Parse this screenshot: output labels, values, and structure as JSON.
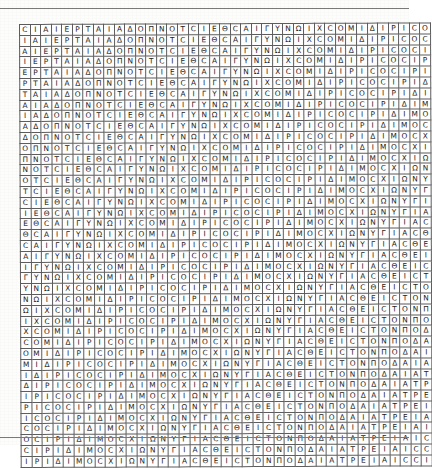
{
  "page": {
    "background_color": "#fdfdfc",
    "rule_color": "#7a7a7a",
    "width": 409,
    "height": 445
  },
  "grid": {
    "name": "greek-letter-diagonal-grid",
    "rows": 41,
    "columns": 39,
    "cell_width": 9.538,
    "cell_height": 9.805,
    "line_color": "#5d5d5d",
    "text_color": "#1d1d1d",
    "cell_background": "#ffffff",
    "description": "Square lattice of hand-lettered Greek/Latin capitals; every row is the preceding row shifted one cell to the left, producing diagonal stripes of identical letters.",
    "alphabet": [
      "A",
      "C",
      "E",
      "I",
      "M",
      "N",
      "O",
      "P",
      "T",
      "X",
      "Y",
      "Δ",
      "Θ",
      "Λ",
      "Π",
      "Γ",
      "Ω"
    ],
    "first_row": "CIAIEPTAIAΔOΠNOTCIEΘEICTONΠOΔAIATPEIAIC",
    "center_row": "EΘCAIΓYNΩIXCOMIΔIPICOCIPIΔIMOCXIΩNYΓIACΘE",
    "last_row": "CIAIEPTAIAΔOΠNOTCIEΘEICTONΠOΔAIATPEIAIC",
    "master_sequence": "CIAIEPTAIAΔOΠNOTCIEΘCAIΓYNΩIXCOMIΔIPICOCIPIΔIMOCXIΩNYΓIACΘEICTONΠOΔAIATPEIAIC",
    "center_palindrome": "PICOCIP"
  }
}
